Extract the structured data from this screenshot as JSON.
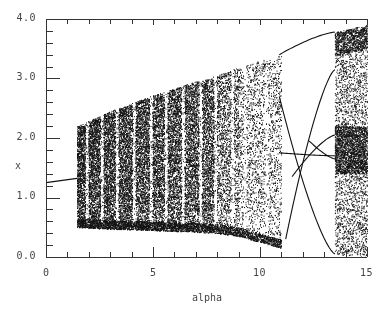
{
  "chart_data": {
    "type": "scatter",
    "title": "",
    "xlabel": "alpha",
    "ylabel": "x",
    "xlim": [
      0,
      15
    ],
    "ylim": [
      0.0,
      4.0
    ],
    "xticks": [
      0,
      5,
      10,
      15
    ],
    "xtick_labels": [
      "0",
      "5",
      "10",
      "15"
    ],
    "yticks": [
      0.0,
      1.0,
      2.0,
      3.0,
      4.0
    ],
    "ytick_labels": [
      "0.0",
      "1.0",
      "2.0",
      "3.0",
      "4.0"
    ],
    "x_minor_step": 1,
    "y_minor_step": 0.2,
    "grid": false,
    "legend": null,
    "fixed_point": {
      "alpha": [
        0,
        1.45
      ],
      "x": [
        1.25,
        1.32
      ]
    },
    "chaotic_band": {
      "alpha_start": 1.45,
      "alpha_end": 11.0,
      "upper": [
        [
          1.45,
          2.2
        ],
        [
          3,
          2.45
        ],
        [
          5,
          2.72
        ],
        [
          7,
          2.95
        ],
        [
          8,
          3.05
        ],
        [
          9,
          3.2
        ],
        [
          10,
          3.3
        ],
        [
          11,
          3.4
        ]
      ],
      "lower": [
        [
          1.45,
          0.5
        ],
        [
          3,
          0.47
        ],
        [
          5,
          0.45
        ],
        [
          7,
          0.42
        ],
        [
          8,
          0.4
        ],
        [
          9,
          0.35
        ],
        [
          10,
          0.25
        ],
        [
          11,
          0.15
        ]
      ],
      "windows": [
        1.9,
        2.6,
        3.3,
        4.1,
        4.9,
        5.6,
        6.4,
        7.2,
        7.9,
        8.7,
        9.3,
        10.3
      ]
    },
    "periodic_branches": [
      {
        "alpha": [
          10.9,
          13.5
        ],
        "x": [
          3.4,
          3.78
        ]
      },
      {
        "alpha": [
          10.9,
          13.5
        ],
        "x": [
          2.7,
          0.05
        ]
      },
      {
        "alpha": [
          11.2,
          13.5
        ],
        "x": [
          0.3,
          3.15
        ]
      },
      {
        "alpha": [
          10.9,
          13.5
        ],
        "x": [
          1.75,
          1.7
        ]
      },
      {
        "alpha": [
          11.5,
          13.5
        ],
        "x": [
          1.35,
          2.05
        ]
      },
      {
        "alpha": [
          12.3,
          13.5
        ],
        "x": [
          1.95,
          1.65
        ]
      }
    ],
    "chaotic_band_2": {
      "alpha_start": 13.5,
      "alpha_end": 15.0,
      "upper": [
        [
          13.5,
          3.78
        ],
        [
          15,
          3.9
        ]
      ],
      "lower": [
        [
          13.5,
          0.05
        ],
        [
          15,
          0.0
        ]
      ],
      "dense_region": {
        "alpha": [
          13.5,
          15
        ],
        "x": [
          1.4,
          2.2
        ]
      }
    }
  },
  "axes": {
    "xlabel": "alpha",
    "ylabel": "x"
  }
}
